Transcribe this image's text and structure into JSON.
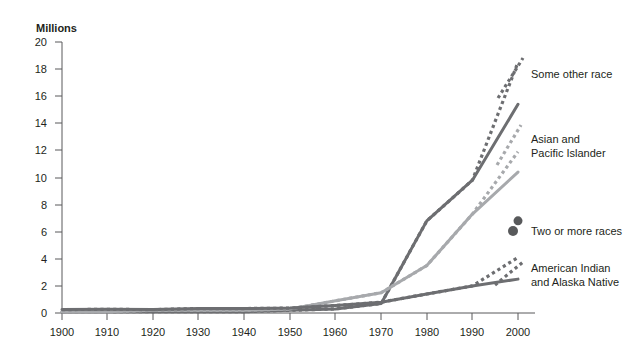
{
  "chart_data": {
    "type": "line",
    "title": "",
    "subtitle": "",
    "unit_label": "Millions",
    "xlabel": "",
    "ylabel": "",
    "xlim": [
      1900,
      2000
    ],
    "ylim": [
      0,
      20
    ],
    "grid": false,
    "legend_position": "right",
    "x": [
      1900,
      1910,
      1920,
      1930,
      1940,
      1950,
      1960,
      1970,
      1980,
      1990,
      2000
    ],
    "xtick_labels": [
      "1900",
      "1910",
      "1920",
      "1930",
      "1940",
      "1950",
      "1960",
      "1970",
      "1980",
      "1990",
      "2000"
    ],
    "ytick_labels": [
      "0",
      "2",
      "4",
      "6",
      "8",
      "10",
      "12",
      "14",
      "16",
      "18",
      "20"
    ],
    "ytick_values": [
      0,
      2,
      4,
      6,
      8,
      10,
      12,
      14,
      16,
      18,
      20
    ],
    "series": [
      {
        "name": "Some other race",
        "style": "dotted",
        "color": "#6d6e71",
        "values": [
          0.1,
          0.1,
          0.1,
          0.1,
          0.1,
          0.2,
          0.3,
          0.7,
          6.8,
          9.8,
          18.5
        ]
      },
      {
        "name": "Some other race solid",
        "style": "solid",
        "color": "#6d6e71",
        "values": [
          0.1,
          0.1,
          0.1,
          0.1,
          0.1,
          0.2,
          0.3,
          0.7,
          6.8,
          9.8,
          15.4
        ]
      },
      {
        "name": "Asian and Pacific Islander",
        "style": "dotted",
        "color": "#a7a9ac",
        "values": [
          0.1,
          0.1,
          0.2,
          0.2,
          0.2,
          0.3,
          0.9,
          1.5,
          3.5,
          7.3,
          11.9
        ]
      },
      {
        "name": "Asian and Pacific Islander solid",
        "style": "solid",
        "color": "#a7a9ac",
        "values": [
          0.1,
          0.1,
          0.2,
          0.2,
          0.2,
          0.3,
          0.9,
          1.5,
          3.5,
          7.3,
          10.4
        ]
      },
      {
        "name": "American Indian and Alaska Native",
        "style": "dotted",
        "color": "#6d6e71",
        "values": [
          0.25,
          0.27,
          0.25,
          0.33,
          0.33,
          0.36,
          0.55,
          0.8,
          1.4,
          2.0,
          4.1
        ]
      },
      {
        "name": "American Indian and Alaska Native solid",
        "style": "solid",
        "color": "#6d6e71",
        "values": [
          0.25,
          0.27,
          0.25,
          0.33,
          0.33,
          0.36,
          0.55,
          0.8,
          1.4,
          2.0,
          2.5
        ]
      },
      {
        "name": "Two or more races",
        "style": "dot",
        "color": "#58595b",
        "values": [
          null,
          null,
          null,
          null,
          null,
          null,
          null,
          null,
          null,
          null,
          6.8
        ]
      }
    ],
    "legend": [
      {
        "label": "Some other race",
        "marker": "dotted-line",
        "color": "#6d6e71"
      },
      {
        "label": "Asian and\nPacific Islander",
        "marker": "dotted-line",
        "color": "#a7a9ac"
      },
      {
        "label": "Two or more races",
        "marker": "dot",
        "color": "#58595b"
      },
      {
        "label": "American Indian\nand Alaska Native",
        "marker": "dotted-line",
        "color": "#6d6e71"
      }
    ]
  },
  "legend_labels": {
    "some_other_race": "Some other race",
    "asian_pacific_1": "Asian and",
    "asian_pacific_2": "Pacific Islander",
    "two_or_more": "Two or more races",
    "amer_indian_1": "American Indian",
    "amer_indian_2": "and Alaska Native"
  },
  "axis": {
    "unit": "Millions",
    "y_ticks": [
      "20",
      "18",
      "16",
      "14",
      "12",
      "10",
      "8",
      "6",
      "4",
      "2",
      "0"
    ],
    "x_ticks": [
      "1900",
      "1910",
      "1920",
      "1930",
      "1940",
      "1950",
      "1960",
      "1970",
      "1980",
      "1990",
      "2000"
    ]
  },
  "colors": {
    "dark_gray": "#6d6e71",
    "light_gray": "#a7a9ac",
    "axis": "#58595b",
    "text": "#231f20",
    "background": "#ffffff"
  }
}
